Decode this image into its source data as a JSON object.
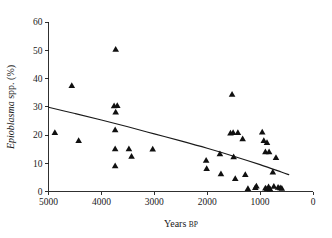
{
  "chart_data": {
    "type": "scatter",
    "title": "",
    "xlabel": "Years BP",
    "xlabel_main": "Years",
    "xlabel_suffix": "BP",
    "ylabel": "Epioblasma spp. (%)",
    "ylabel_italic": "Epioblasma",
    "ylabel_plain": " spp. (%)",
    "xlim": [
      5000,
      0
    ],
    "ylim": [
      0,
      60
    ],
    "x_reversed": true,
    "grid": false,
    "legend": false,
    "xticks": [
      5000,
      4000,
      3000,
      2000,
      1000,
      0
    ],
    "xtick_labels": [
      "5000",
      "4000",
      "3000",
      "2000",
      "1000",
      "0"
    ],
    "yticks": [
      0,
      10,
      20,
      30,
      40,
      50,
      60
    ],
    "ytick_labels": [
      "0",
      "10",
      "20",
      "30",
      "40",
      "50",
      "60"
    ],
    "marker": "triangle",
    "marker_color": "#101010",
    "points": [
      {
        "x": 4880,
        "y": 20.8
      },
      {
        "x": 4560,
        "y": 37.5
      },
      {
        "x": 4430,
        "y": 18.0
      },
      {
        "x": 3730,
        "y": 50.3
      },
      {
        "x": 3760,
        "y": 30.3
      },
      {
        "x": 3700,
        "y": 30.4
      },
      {
        "x": 3730,
        "y": 28.1
      },
      {
        "x": 3740,
        "y": 21.8
      },
      {
        "x": 3740,
        "y": 15.1
      },
      {
        "x": 3740,
        "y": 9.1
      },
      {
        "x": 3480,
        "y": 15.1
      },
      {
        "x": 3430,
        "y": 12.4
      },
      {
        "x": 3030,
        "y": 15.0
      },
      {
        "x": 2020,
        "y": 11.0
      },
      {
        "x": 2010,
        "y": 8.1
      },
      {
        "x": 1760,
        "y": 13.3
      },
      {
        "x": 1740,
        "y": 6.2
      },
      {
        "x": 1530,
        "y": 34.4
      },
      {
        "x": 1560,
        "y": 20.7
      },
      {
        "x": 1510,
        "y": 20.8
      },
      {
        "x": 1420,
        "y": 20.8
      },
      {
        "x": 1500,
        "y": 12.3
      },
      {
        "x": 1470,
        "y": 4.6
      },
      {
        "x": 1330,
        "y": 18.6
      },
      {
        "x": 1280,
        "y": 6.0
      },
      {
        "x": 1230,
        "y": 1.0
      },
      {
        "x": 1090,
        "y": 1.4
      },
      {
        "x": 1070,
        "y": 1.9
      },
      {
        "x": 960,
        "y": 21.0
      },
      {
        "x": 930,
        "y": 18.0
      },
      {
        "x": 900,
        "y": 14.0
      },
      {
        "x": 870,
        "y": 17.3
      },
      {
        "x": 830,
        "y": 14.0
      },
      {
        "x": 900,
        "y": 1.2
      },
      {
        "x": 870,
        "y": 0.9
      },
      {
        "x": 840,
        "y": 1.6
      },
      {
        "x": 810,
        "y": 0.8
      },
      {
        "x": 760,
        "y": 6.9
      },
      {
        "x": 740,
        "y": 1.8
      },
      {
        "x": 700,
        "y": 12.0
      },
      {
        "x": 660,
        "y": 1.5
      },
      {
        "x": 620,
        "y": 1.3
      },
      {
        "x": 590,
        "y": 1.1
      }
    ],
    "trend": {
      "name": "fitted regression curve",
      "points": [
        {
          "x": 5000,
          "y": 29.8
        },
        {
          "x": 4500,
          "y": 27.6
        },
        {
          "x": 4000,
          "y": 25.3
        },
        {
          "x": 3500,
          "y": 22.9
        },
        {
          "x": 3000,
          "y": 20.4
        },
        {
          "x": 2500,
          "y": 17.9
        },
        {
          "x": 2000,
          "y": 15.3
        },
        {
          "x": 1500,
          "y": 12.5
        },
        {
          "x": 1000,
          "y": 9.5
        },
        {
          "x": 600,
          "y": 6.9
        },
        {
          "x": 450,
          "y": 5.9
        }
      ]
    }
  }
}
